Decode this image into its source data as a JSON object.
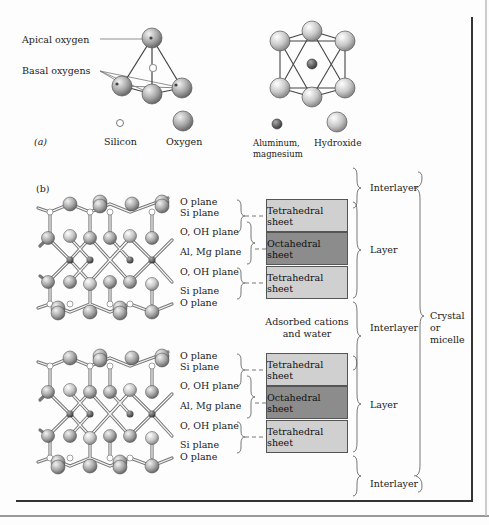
{
  "figure": {
    "panel_a": {
      "label": "(a)",
      "tetrahedron": {
        "apical_label": "Apical oxygen",
        "basal_label": "Basal oxygens"
      },
      "legend": {
        "silicon": "Silicon",
        "oxygen": "Oxygen",
        "aluminum_line1": "Aluminum,",
        "aluminum_line2": "magnesium",
        "hydroxide": "Hydroxide"
      }
    },
    "panel_b": {
      "label": "(b)",
      "upper_planes": [
        "O plane",
        "Si plane",
        "O, OH plane",
        "Al, Mg plane",
        "O, OH plane",
        "Si plane",
        "O plane"
      ],
      "lower_planes": [
        "O plane",
        "Si plane",
        "O, OH plane",
        "Al, Mg plane",
        "O, OH plane",
        "Si plane",
        "O plane"
      ],
      "upper_sheets": [
        "Tetrahedral sheet",
        "Octahedral sheet",
        "Tetrahedral sheet"
      ],
      "lower_sheets": [
        "Tetrahedral sheet",
        "Octahedral sheet",
        "Tetrahedral sheet"
      ],
      "adsorbed_line1": "Adsorbed cations",
      "adsorbed_line2": "and water",
      "braces": {
        "interlayer_top": "Interlayer",
        "layer_upper": "Layer",
        "interlayer_middle": "Interlayer",
        "layer_lower": "Layer",
        "interlayer_bottom": "Interlayer",
        "crystal_line1": "Crystal",
        "crystal_line2": "or",
        "crystal_line3": "micelle"
      }
    },
    "colors": {
      "tetrahedral_sheet": "#d0d0d0",
      "octahedral_sheet": "#8c8c8c",
      "frame": "#333333"
    }
  }
}
